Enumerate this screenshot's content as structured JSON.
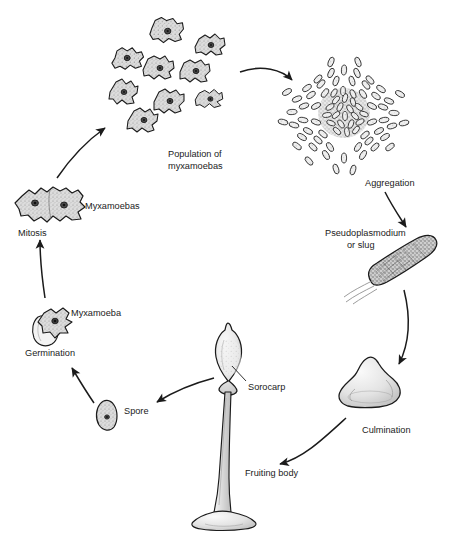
{
  "figure": {
    "background_color": "#ffffff",
    "ink_color": "#1b1b1b",
    "fill_color": "#d9d9d9"
  },
  "labels": {
    "population": {
      "line1": "Population of",
      "line2": "myxamoebas"
    },
    "aggregation": "Aggregation",
    "pseudoplasmodium": {
      "line1": "Pseudoplasmodium",
      "line2": "or slug"
    },
    "culmination": "Culmination",
    "fruiting_body": "Fruiting body",
    "sorocarp": "Sorocarp",
    "spore": "Spore",
    "germination": "Germination",
    "myxamoeba": "Myxamoeba",
    "myxamoebas": "Myxamoebas",
    "mitosis": "Mitosis"
  },
  "stages": [
    {
      "id": "mitosis",
      "label": "Mitosis",
      "order": 1
    },
    {
      "id": "myxamoebas",
      "label": "Myxamoebas",
      "order": 2
    },
    {
      "id": "population",
      "label": "Population of myxamoebas",
      "order": 3
    },
    {
      "id": "aggregation",
      "label": "Aggregation",
      "order": 4
    },
    {
      "id": "pseudoplasmodium",
      "label": "Pseudoplasmodium or slug",
      "order": 5
    },
    {
      "id": "culmination",
      "label": "Culmination",
      "order": 6
    },
    {
      "id": "fruiting-body",
      "label": "Fruiting body",
      "order": 7
    },
    {
      "id": "sorocarp",
      "label": "Sorocarp",
      "order": 8
    },
    {
      "id": "spore",
      "label": "Spore",
      "order": 9
    },
    {
      "id": "germination",
      "label": "Germination",
      "order": 10
    },
    {
      "id": "myxamoeba",
      "label": "Myxamoeba",
      "order": 11
    }
  ]
}
